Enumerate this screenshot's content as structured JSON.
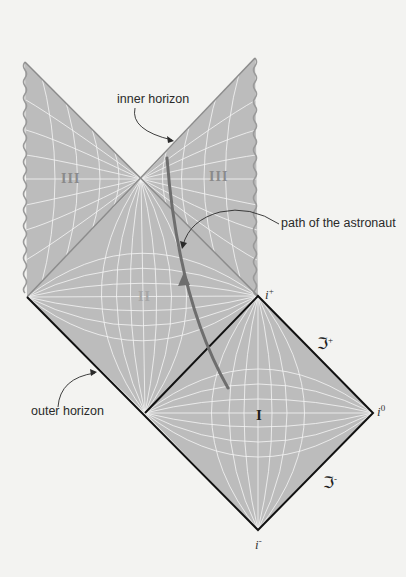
{
  "colors": {
    "background": "#f3f3f1",
    "region_fill": "#bdbdbd",
    "grid_line": "#ffffff",
    "outer_horizon": "#111111",
    "inner_horizon": "#8c8c8c",
    "astronaut_path": "#6e6e6e",
    "singularity_edge": "#9a9a9a"
  },
  "annotations": {
    "inner_horizon": "inner horizon",
    "path_of_astronaut": "path of the astronaut",
    "outer_horizon": "outer horizon"
  },
  "regions": {
    "region_I": "I",
    "region_II": "II",
    "region_III_left": "III",
    "region_III_right": "III"
  },
  "points": {
    "i_plus": {
      "base": "i",
      "sup": "+"
    },
    "i_zero": {
      "base": "i",
      "sup": "0"
    },
    "i_minus": {
      "base": "i",
      "sup": "-"
    }
  },
  "null_infinity": {
    "scri_plus": {
      "base": "ℑ",
      "sup": "+"
    },
    "scri_minus": {
      "base": "ℑ",
      "sup": "-"
    }
  },
  "geometry": {
    "region_I_vertices": {
      "top": [
        258,
        296
      ],
      "right": [
        373,
        413
      ],
      "bottom": [
        258,
        530
      ],
      "left": [
        145,
        413
      ]
    },
    "region_II_vertices": {
      "top": [
        141,
        179
      ],
      "right": [
        258,
        296
      ],
      "bottom": [
        145,
        413
      ],
      "left": [
        27,
        297
      ]
    },
    "region_III_left_vertices": {
      "tip": [
        25,
        62
      ],
      "apex": [
        141,
        179
      ],
      "bottom": [
        27,
        297
      ]
    },
    "region_III_right_vertices": {
      "tip": [
        255,
        58
      ],
      "apex": [
        141,
        179
      ],
      "bottom": [
        258,
        296
      ]
    },
    "astronaut_path": {
      "start": [
        228,
        388
      ],
      "end": [
        167,
        158
      ],
      "arrow_at": [
        184,
        280
      ]
    }
  }
}
